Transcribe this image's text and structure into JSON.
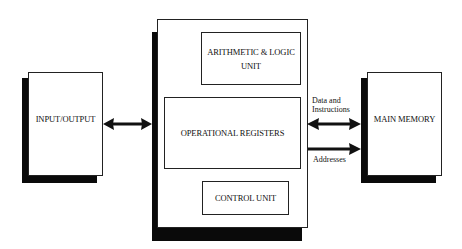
{
  "diagram": {
    "blocks": {
      "io": {
        "label": "INPUT/OUTPUT"
      },
      "cpu": {
        "alu": {
          "label_line1": "ARITHMETIC & LOGIC",
          "label_line2": "UNIT"
        },
        "registers": {
          "label": "OPERATIONAL REGISTERS"
        },
        "control": {
          "label": "CONTROL UNIT"
        }
      },
      "memory": {
        "label": "MAIN MEMORY"
      }
    },
    "connections": {
      "io_cpu": {
        "type": "bidirectional"
      },
      "data": {
        "label_line1": "Data and",
        "label_line2": "Instructions",
        "type": "bidirectional"
      },
      "addresses": {
        "label": "Addresses",
        "type": "unidirectional"
      }
    },
    "colors": {
      "line": "#111111",
      "shadow": "#0a0a0a",
      "fill": "#ffffff"
    }
  }
}
